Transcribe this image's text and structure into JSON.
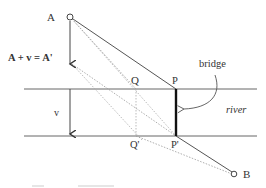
{
  "diagram": {
    "points": {
      "A": "A",
      "A_prime_equation": "A + v = A'",
      "v": "v",
      "Q": "Q",
      "P": "P",
      "Q_prime": "Q'",
      "P_prime": "P'",
      "B": "B"
    },
    "annotations": {
      "bridge": "bridge",
      "river": "river"
    },
    "colors": {
      "line": "#555555",
      "bridge": "#111111",
      "dotted": "#888888",
      "text": "#333333"
    }
  }
}
